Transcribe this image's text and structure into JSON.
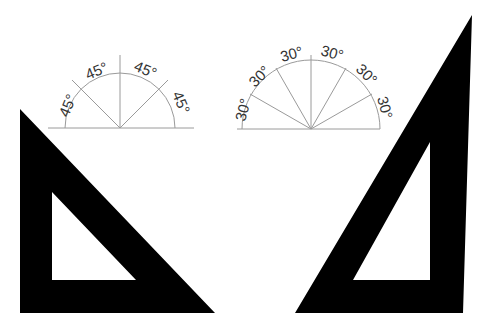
{
  "diagram": {
    "colors": {
      "background": "#ffffff",
      "triangle_fill": "#000000",
      "guide_line": "#9a9a9a",
      "label_text": "#333333"
    },
    "protractor_45": {
      "labels": [
        "45°",
        "45°",
        "45°",
        "45°"
      ],
      "center": [
        120,
        128
      ],
      "radius": 55,
      "divisions_deg": 45
    },
    "protractor_30": {
      "labels": [
        "30°",
        "30°",
        "30°",
        "30°",
        "30°",
        "30°"
      ],
      "center": [
        311,
        129
      ],
      "radius": 69,
      "divisions_deg": 30
    },
    "set_square_45": {
      "name": "45-degree set square",
      "outer": [
        [
          20,
          109
        ],
        [
          20,
          313
        ],
        [
          215,
          313
        ]
      ],
      "inner": [
        [
          52,
          192
        ],
        [
          52,
          280
        ],
        [
          136,
          280
        ]
      ]
    },
    "set_square_30_60": {
      "name": "30/60-degree set square",
      "outer": [
        [
          472,
          15
        ],
        [
          295,
          313
        ],
        [
          463,
          313
        ]
      ],
      "inner": [
        [
          430,
          142
        ],
        [
          353,
          280
        ],
        [
          430,
          280
        ]
      ]
    }
  }
}
